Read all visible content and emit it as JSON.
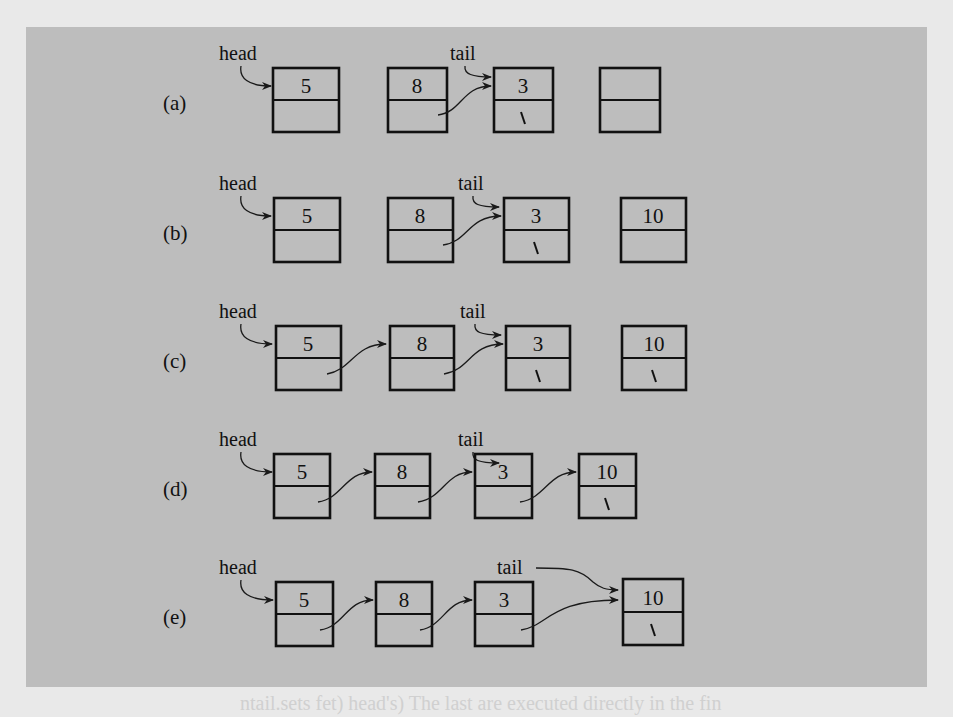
{
  "figure": {
    "type": "linked-list-insertion-steps",
    "panel_color": "#bdbdbd",
    "page_color": "#e9e9e9",
    "ink_color": "#111111",
    "pointer_labels": {
      "head": "head",
      "tail": "tail"
    },
    "null_marker": "\\",
    "rows": [
      {
        "label": "(a)",
        "nodes": [
          {
            "value": "5",
            "next": ""
          },
          {
            "value": "8",
            "next": "→3"
          },
          {
            "value": "3",
            "next": "\\"
          },
          {
            "value": "",
            "next": ""
          }
        ],
        "head_points_to": 0,
        "tail_points_to": 2
      },
      {
        "label": "(b)",
        "nodes": [
          {
            "value": "5",
            "next": ""
          },
          {
            "value": "8",
            "next": "→3"
          },
          {
            "value": "3",
            "next": "\\"
          },
          {
            "value": "10",
            "next": ""
          }
        ],
        "head_points_to": 0,
        "tail_points_to": 2
      },
      {
        "label": "(c)",
        "nodes": [
          {
            "value": "5",
            "next": "→8"
          },
          {
            "value": "8",
            "next": "→3"
          },
          {
            "value": "3",
            "next": "\\"
          },
          {
            "value": "10",
            "next": "\\"
          }
        ],
        "head_points_to": 0,
        "tail_points_to": 2
      },
      {
        "label": "(d)",
        "nodes": [
          {
            "value": "5",
            "next": "→8"
          },
          {
            "value": "8",
            "next": "→3"
          },
          {
            "value": "3",
            "next": "→10"
          },
          {
            "value": "10",
            "next": "\\"
          }
        ],
        "head_points_to": 0,
        "tail_points_to": 2
      },
      {
        "label": "(e)",
        "nodes": [
          {
            "value": "5",
            "next": "→8"
          },
          {
            "value": "8",
            "next": "→3"
          },
          {
            "value": "3",
            "next": "→10"
          },
          {
            "value": "10",
            "next": "\\"
          }
        ],
        "head_points_to": 0,
        "tail_points_to": 3
      }
    ]
  },
  "bleed_text": "ntail.sets fet) head's) The last are executed directly in the fin"
}
